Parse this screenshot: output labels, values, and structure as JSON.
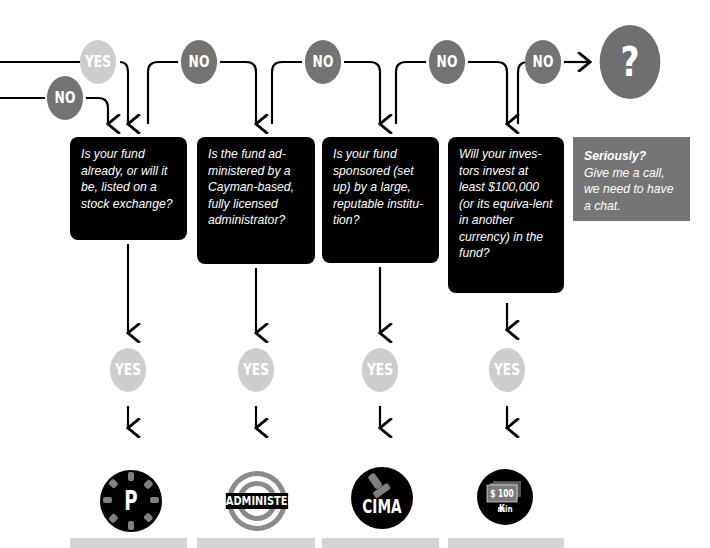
{
  "flow": {
    "start_branches": [
      {
        "label": "YES",
        "color": "#cdcdcd"
      },
      {
        "label": "NO",
        "color": "#737373"
      }
    ],
    "questions": [
      {
        "text": "Is your fund already, or will it be, listed on a stock exchange?",
        "no_label": "NO",
        "yes_label": "YES",
        "icon": {
          "name": "listed-fund-icon",
          "label": "P"
        }
      },
      {
        "text": "Is the fund ad-ministered by a Cayman-based, fully licensed administrator?",
        "no_label": "NO",
        "yes_label": "YES",
        "icon": {
          "name": "administered-icon",
          "label": "ADMINISTERED"
        }
      },
      {
        "text": "Is your fund sponsored (set up) by a large, reputable institu-tion?",
        "no_label": "NO",
        "yes_label": "YES",
        "icon": {
          "name": "cima-stamp-icon",
          "label": "CIMA"
        }
      },
      {
        "text": "Will your inves-tors invest at least $100,000 (or its equiva-lent in another currency) in the fund?",
        "no_label": "NO",
        "yes_label": "YES",
        "icon": {
          "name": "money-100k-icon",
          "label": "$ 100 K",
          "sublabel": "min"
        }
      }
    ],
    "final_no_label": "NO",
    "final": {
      "symbol": "?",
      "title": "Seriously?",
      "text": "Give me a call, we need to have a chat."
    }
  },
  "colors": {
    "yes": "#cdcdcd",
    "no": "#737373",
    "box": "#000000",
    "gray_box": "#757575",
    "bar": "#d4d4d4"
  }
}
